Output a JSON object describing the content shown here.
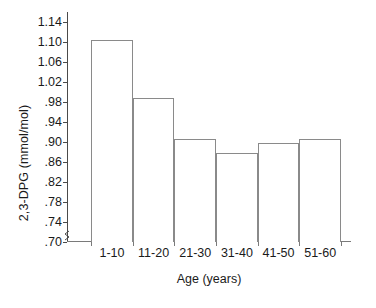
{
  "chart_data": {
    "type": "bar",
    "title": "",
    "xlabel": "Age (years)",
    "ylabel": "2,3-DPG (mmol/mol)",
    "categories": [
      "1-10",
      "11-20",
      "21-30",
      "31-40",
      "41-50",
      "51-60"
    ],
    "values": [
      1.105,
      0.988,
      0.906,
      0.878,
      0.899,
      0.907
    ],
    "ylim": [
      0.7,
      1.16
    ],
    "y_ticks": [
      0.7,
      0.74,
      0.78,
      0.82,
      0.86,
      0.9,
      0.94,
      0.98,
      1.02,
      1.06,
      1.1,
      1.14
    ],
    "y_tick_labels": [
      ".70",
      ".74",
      ".78",
      ".82",
      ".86",
      ".90",
      ".94",
      ".98",
      "1.02",
      "1.06",
      "1.10",
      "1.14"
    ],
    "grid": false,
    "legend": null,
    "legend_position": "none",
    "bar_style": {
      "fill": "#ffffff",
      "edge": "#8a8a8a",
      "contiguous": true
    },
    "axis_color": "#4a4a4a",
    "text_color": "#1a1a1a",
    "axis_break": true,
    "annotations": []
  },
  "figure": {
    "background": "#ffffff"
  }
}
